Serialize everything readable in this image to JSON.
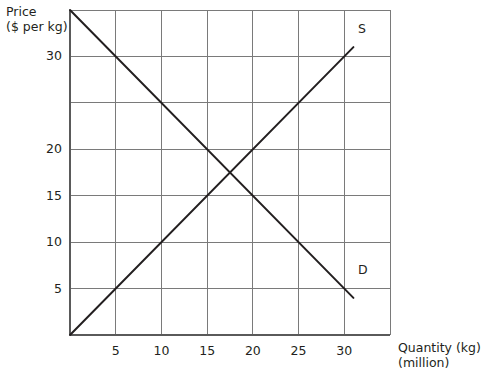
{
  "chart_data": {
    "type": "line",
    "title": "",
    "ylabel_line1": "Price",
    "ylabel_line2": "($ per kg)",
    "xlabel_line1": "Quantity (kg)",
    "xlabel_line2": "(million)",
    "xlim": [
      0,
      35
    ],
    "ylim": [
      0,
      35
    ],
    "grid": true,
    "legend": "inline-curve-labels",
    "x_ticks": [
      {
        "value": 5,
        "label": "5"
      },
      {
        "value": 10,
        "label": "10"
      },
      {
        "value": 15,
        "label": "15"
      },
      {
        "value": 20,
        "label": "20"
      },
      {
        "value": 25,
        "label": "25"
      },
      {
        "value": 30,
        "label": "30"
      }
    ],
    "y_ticks": [
      {
        "value": 5,
        "label": "5"
      },
      {
        "value": 10,
        "label": "10"
      },
      {
        "value": 15,
        "label": "15"
      },
      {
        "value": 20,
        "label": "20"
      },
      {
        "value": 25,
        "label": ""
      },
      {
        "value": 30,
        "label": "30"
      }
    ],
    "gridlines_x": [
      5,
      10,
      15,
      20,
      25,
      30
    ],
    "gridlines_y": [
      5,
      10,
      15,
      20,
      25,
      30
    ],
    "series": [
      {
        "name": "D",
        "label": "D",
        "description": "Demand curve",
        "color": "#231f20",
        "points": [
          [
            0,
            35
          ],
          [
            31,
            4
          ]
        ],
        "label_at": [
          31.5,
          7
        ]
      },
      {
        "name": "S",
        "label": "S",
        "description": "Supply curve",
        "color": "#231f20",
        "points": [
          [
            0,
            0
          ],
          [
            31,
            31
          ]
        ],
        "label_at": [
          31.5,
          33
        ]
      }
    ],
    "equilibrium": {
      "quantity": 17.5,
      "price": 17.5
    },
    "colors": {
      "line": "#231f20",
      "grid": "#7a7a7a",
      "axis": "#5a5a5a",
      "background": "#ffffff",
      "text": "#231f20"
    }
  }
}
